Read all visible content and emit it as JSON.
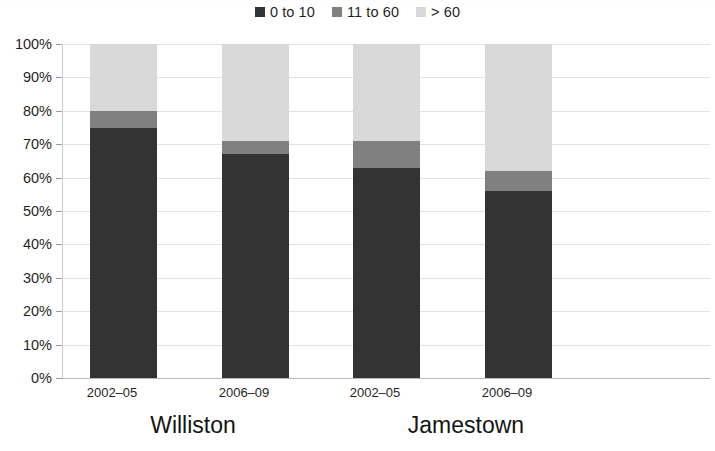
{
  "chart_data": {
    "type": "bar",
    "subtype": "stacked-percent-column",
    "title": "",
    "subtitle": "",
    "xlabel": "",
    "ylabel": "",
    "ylim": [
      0,
      100
    ],
    "ytick_labels": [
      "100%",
      "90%",
      "80%",
      "70%",
      "60%",
      "50%",
      "40%",
      "30%",
      "20%",
      "10%",
      "0%"
    ],
    "ytick_values": [
      100,
      90,
      80,
      70,
      60,
      50,
      40,
      30,
      20,
      10,
      0
    ],
    "grid": true,
    "legend_position": "top-center",
    "legend": [
      "0 to 10",
      "11 to 60",
      "> 60"
    ],
    "categories": [
      "2002–05",
      "2006–09",
      "2002–05",
      "2006–09"
    ],
    "groups": [
      {
        "label": "Williston",
        "categories": [
          "2002–05",
          "2006–09"
        ]
      },
      {
        "label": "Jamestown",
        "categories": [
          "2002–05",
          "2006–09"
        ]
      }
    ],
    "series": [
      {
        "name": "0 to 10",
        "color": "#333333",
        "values": [
          75,
          67,
          63,
          56
        ]
      },
      {
        "name": "11 to 60",
        "color": "#808080",
        "values": [
          5,
          4,
          8,
          6
        ]
      },
      {
        "name": "> 60",
        "color": "#d9d9d9",
        "values": [
          20,
          29,
          29,
          38
        ]
      }
    ],
    "bars": [
      {
        "group": "Williston",
        "category": "2002–05",
        "segments": [
          75,
          5,
          20
        ]
      },
      {
        "group": "Williston",
        "category": "2006–09",
        "segments": [
          67,
          4,
          29
        ]
      },
      {
        "group": "Jamestown",
        "category": "2002–05",
        "segments": [
          63,
          8,
          29
        ]
      },
      {
        "group": "Jamestown",
        "category": "2006–09",
        "segments": [
          56,
          6,
          38
        ]
      }
    ],
    "colors": {
      "series_0_to_10": "#333333",
      "series_11_to_60": "#808080",
      "series_gt_60": "#d9d9d9",
      "gridline": "#e3e3e3",
      "axis": "#b8b8b8",
      "text": "#1f1f1f",
      "background": "#ffffff"
    }
  },
  "legend": {
    "items": [
      {
        "label": "0 to 10",
        "swatch": "#333333",
        "icon": "legend-swatch-icon"
      },
      {
        "label": "11 to 60",
        "swatch": "#808080",
        "icon": "legend-swatch-icon"
      },
      {
        "label": "> 60",
        "swatch": "#d9d9d9",
        "icon": "legend-swatch-icon"
      }
    ]
  },
  "axes": {
    "y": {
      "labels": [
        "100%",
        "90%",
        "80%",
        "70%",
        "60%",
        "50%",
        "40%",
        "30%",
        "20%",
        "10%",
        "0%"
      ]
    },
    "x": {
      "tick_labels": [
        "2002–05",
        "2006–09",
        "2002–05",
        "2006–09"
      ],
      "group_labels": [
        "Williston",
        "Jamestown"
      ]
    }
  }
}
